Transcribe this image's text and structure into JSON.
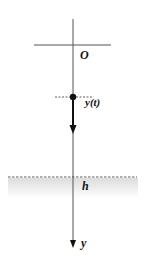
{
  "diagram": {
    "title": "",
    "labels": {
      "origin": "O",
      "position": "y(t)",
      "level": "h",
      "axis": "y"
    },
    "colors": {
      "line": "#555555",
      "ink": "#111111",
      "shade": "#e6e6e6"
    }
  }
}
